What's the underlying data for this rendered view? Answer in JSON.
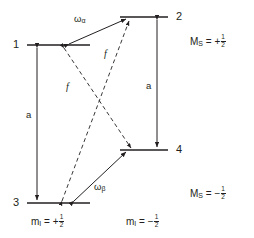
{
  "diagram": {
    "type": "energy-level-diagram",
    "stroke_color": "#231f20",
    "background_color": "#ffffff",
    "levels": [
      {
        "id": "level-1",
        "number": "1",
        "column": "left",
        "ms": "+1/2",
        "mi": "+1/2",
        "y": 45,
        "x1": 27,
        "x2": 90
      },
      {
        "id": "level-2",
        "number": "2",
        "column": "right",
        "ms": "+1/2",
        "mi": "-1/2",
        "y": 17,
        "x1": 120,
        "x2": 168
      },
      {
        "id": "level-3",
        "number": "3",
        "column": "left",
        "ms": "-1/2",
        "mi": "+1/2",
        "y": 203,
        "x1": 27,
        "x2": 90
      },
      {
        "id": "level-4",
        "number": "4",
        "column": "right",
        "ms": "-1/2",
        "mi": "-1/2",
        "y": 150,
        "x1": 120,
        "x2": 168
      }
    ],
    "transitions": [
      {
        "id": "transition-a-left",
        "label": "a",
        "style": "solid",
        "from": "level-1",
        "to": "level-3",
        "kind": "hyperfine"
      },
      {
        "id": "transition-a-right",
        "label": "a",
        "style": "solid",
        "from": "level-2",
        "to": "level-4",
        "kind": "hyperfine"
      },
      {
        "id": "transition-omega-alpha",
        "label": "ω",
        "sub": "α",
        "style": "solid",
        "from": "level-1",
        "to": "level-2",
        "kind": "nmr"
      },
      {
        "id": "transition-omega-beta",
        "label": "ω",
        "sub": "β",
        "style": "solid",
        "from": "level-3",
        "to": "level-4",
        "kind": "nmr"
      },
      {
        "id": "transition-f-upper",
        "label": "f",
        "style": "dashed",
        "from": "level-3",
        "to": "level-2",
        "kind": "flip-flop"
      },
      {
        "id": "transition-f-lower",
        "label": "f",
        "style": "dashed",
        "from": "level-1",
        "to": "level-4",
        "kind": "flip-flop"
      }
    ],
    "labels": {
      "level_1": "1",
      "level_2": "2",
      "level_3": "3",
      "level_4": "4",
      "a_left": "a",
      "a_right": "a",
      "f_upper": "f",
      "f_lower": "f",
      "omega_alpha_base": "ω",
      "omega_alpha_sub": "α",
      "omega_beta_base": "ω",
      "omega_beta_sub": "β",
      "ms_up_symbol": "M",
      "ms_up_sub": "S",
      "ms_up_eq": "= +",
      "ms_up_num": "1",
      "ms_up_den": "2",
      "ms_down_symbol": "M",
      "ms_down_sub": "S",
      "ms_down_eq": "= −",
      "ms_down_num": "1",
      "ms_down_den": "2",
      "mi_left_symbol": "m",
      "mi_left_sub": "I",
      "mi_left_eq": "= +",
      "mi_left_num": "1",
      "mi_left_den": "2",
      "mi_right_symbol": "m",
      "mi_right_sub": "I",
      "mi_right_eq": "= −",
      "mi_right_num": "1",
      "mi_right_den": "2"
    }
  }
}
